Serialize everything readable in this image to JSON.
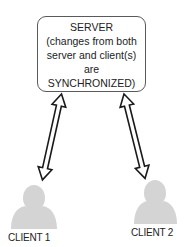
{
  "server": {
    "lines": [
      "SERVER",
      "(changes from both",
      "server and client(s)",
      "are",
      "SYNCHRONIZED)"
    ]
  },
  "clients": [
    {
      "label": "CLIENT 1"
    },
    {
      "label": "CLIENT 2"
    }
  ],
  "colors": {
    "person_fill": "#d4d4d4",
    "box_border": "#5a5a5a",
    "arrow_stroke": "#1a1a1a",
    "text": "#222222"
  }
}
